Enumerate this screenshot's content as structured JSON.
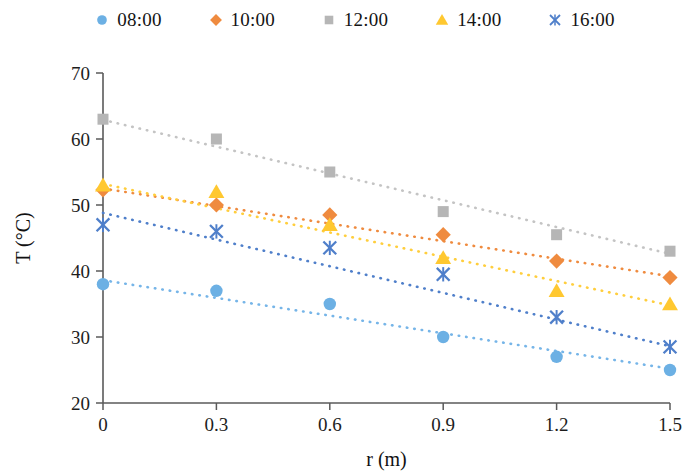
{
  "chart_data": {
    "type": "scatter",
    "title": "",
    "xlabel": "r (m)",
    "ylabel": "T (°C)",
    "x": [
      0,
      0.3,
      0.6,
      0.9,
      1.2,
      1.5
    ],
    "xticklabels": [
      "0",
      "0.3",
      "0.6",
      "0.9",
      "1.2",
      "1.5"
    ],
    "yticklabels": [
      "20",
      "30",
      "40",
      "50",
      "60",
      "70"
    ],
    "yticks": [
      20,
      30,
      40,
      50,
      60,
      70
    ],
    "xlim": [
      0,
      1.5
    ],
    "ylim": [
      20,
      70
    ],
    "grid": false,
    "legend_position": "top",
    "trendlines": "dotted linear per series",
    "series": [
      {
        "name": "08:00",
        "marker": "circle",
        "color": "#5b9bd5",
        "marker_color": "#6cb0e4",
        "line_color": "#76b5e8",
        "values": [
          38,
          37,
          35,
          30,
          27,
          25
        ],
        "trend_start": 38.6,
        "trend_end": 25.2
      },
      {
        "name": "10:00",
        "marker": "diamond",
        "color": "#ed7d31",
        "marker_color": "#ef8b3f",
        "line_color": "#ef8b3f",
        "values": [
          52.3,
          50,
          48.5,
          45.5,
          41.5,
          39
        ],
        "trend_start": 52.5,
        "trend_end": 39.2
      },
      {
        "name": "12:00",
        "marker": "square",
        "color": "#a5a5a5",
        "marker_color": "#b6b6b6",
        "line_color": "#c4c4c4",
        "values": [
          63,
          60,
          55,
          49,
          45.5,
          43
        ],
        "trend_start": 62.9,
        "trend_end": 42.6
      },
      {
        "name": "14:00",
        "marker": "triangle",
        "color": "#ffc000",
        "marker_color": "#ffc830",
        "line_color": "#ffce3d",
        "values": [
          53,
          52,
          47,
          42,
          37,
          35
        ],
        "trend_start": 53.2,
        "trend_end": 34.8
      },
      {
        "name": "16:00",
        "marker": "cross",
        "color": "#4472c4",
        "marker_color": "#4f7fca",
        "line_color": "#4f7fca",
        "values": [
          47,
          46,
          43.5,
          39.5,
          33,
          28.5
        ],
        "trend_start": 48.8,
        "trend_end": 28.6
      }
    ]
  }
}
